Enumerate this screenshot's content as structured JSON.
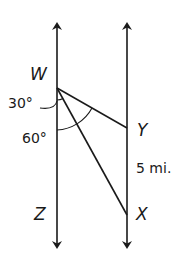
{
  "diagram": {
    "type": "geometry",
    "points": {
      "W": {
        "label": "W",
        "x": 57,
        "y": 88
      },
      "Y": {
        "label": "Y",
        "x": 127,
        "y": 128
      },
      "X": {
        "label": "X",
        "x": 127,
        "y": 215
      },
      "Z": {
        "label": "Z",
        "x": 57,
        "y": 215
      }
    },
    "lines": [
      {
        "name": "left-parallel-line",
        "x": 57,
        "y_top": 25,
        "y_bottom": 246,
        "arrows": "both"
      },
      {
        "name": "right-parallel-line",
        "x": 127,
        "y_top": 25,
        "y_bottom": 246,
        "arrows": "both"
      },
      {
        "name": "segment-WY",
        "from": "W",
        "to": "Y"
      },
      {
        "name": "segment-WX",
        "from": "W",
        "to": "X"
      }
    ],
    "angles": [
      {
        "name": "angle-30",
        "label": "30°",
        "description": "between WZ and WX"
      },
      {
        "name": "angle-60",
        "label": "60°",
        "description": "between WZ and WY"
      }
    ],
    "distance": {
      "label": "5 mi.",
      "between": [
        "Y",
        "X"
      ]
    },
    "labels": {
      "W": "W",
      "Y": "Y",
      "X": "X",
      "Z": "Z",
      "angle_30": "30°",
      "angle_60": "60°",
      "distance_yx": "5 mi."
    },
    "colors": {
      "stroke": "#1a1a1a",
      "background": "#ffffff"
    }
  }
}
